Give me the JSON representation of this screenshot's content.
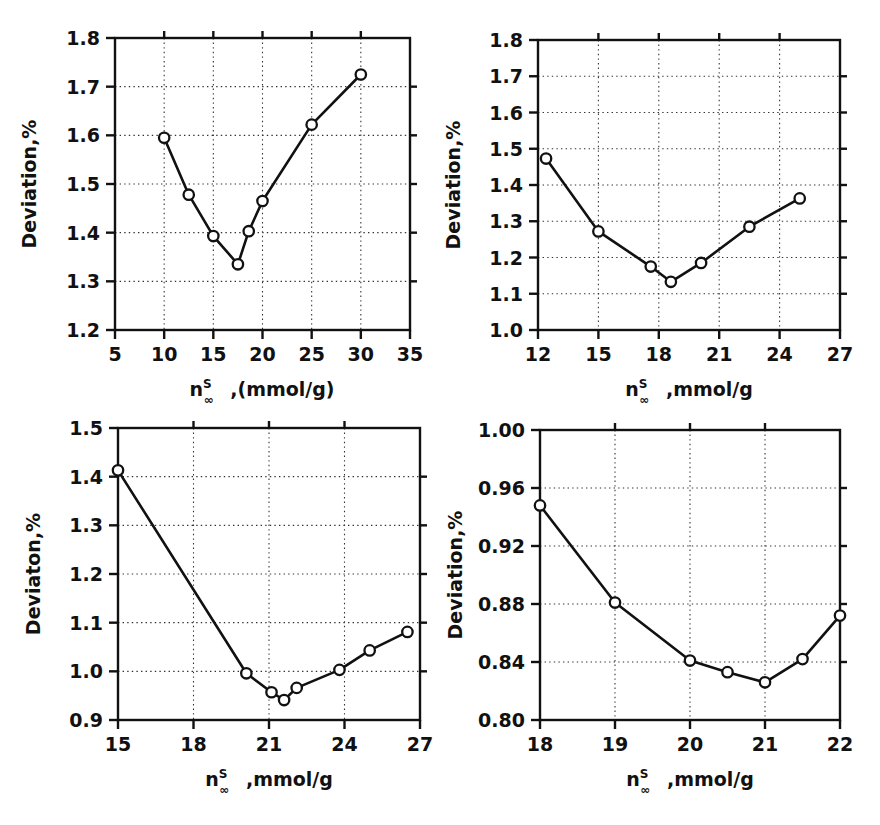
{
  "figure": {
    "title": "",
    "panel_count": 4,
    "marker_style": "open-circle",
    "line_color": "#111111",
    "marker_fill": "#ffffff",
    "grid_color": "#333333",
    "background": "#ffffff"
  },
  "chart_data": [
    {
      "id": "panel-a",
      "type": "line",
      "title": "",
      "xlabel": "n∞ᴿ ,(mmol/g)",
      "xlabel_parts": {
        "base": "n",
        "superscript": "S",
        "subscript": "∞",
        "rest": ",(mmol/g)"
      },
      "ylabel": "Deviation,%",
      "xlim": [
        5,
        35
      ],
      "ylim": [
        1.2,
        1.8
      ],
      "xticks": [
        5,
        10,
        15,
        20,
        25,
        30,
        35
      ],
      "xtick_labels": [
        "5",
        "10",
        "15",
        "20",
        "25",
        "30",
        "35"
      ],
      "yticks": [
        1.2,
        1.3,
        1.4,
        1.5,
        1.6,
        1.7,
        1.8
      ],
      "ytick_labels": [
        "1.2",
        "1.3",
        "1.4",
        "1.5",
        "1.6",
        "1.7",
        "1.8"
      ],
      "grid": true,
      "legend": "none",
      "x": [
        10.0,
        12.5,
        15.0,
        17.5,
        18.6,
        20.0,
        25.0,
        30.0
      ],
      "y": [
        1.595,
        1.478,
        1.393,
        1.335,
        1.403,
        1.465,
        1.622,
        1.725
      ]
    },
    {
      "id": "panel-b",
      "type": "line",
      "title": "",
      "xlabel": "n∞ᴿ ,mmol/g",
      "xlabel_parts": {
        "base": "n",
        "superscript": "S",
        "subscript": "∞",
        "rest": ",mmol/g"
      },
      "ylabel": "Deviation,%",
      "xlim": [
        12,
        27
      ],
      "ylim": [
        1.0,
        1.8
      ],
      "xticks": [
        12,
        15,
        18,
        21,
        24,
        27
      ],
      "xtick_labels": [
        "12",
        "15",
        "18",
        "21",
        "24",
        "27"
      ],
      "yticks": [
        1.0,
        1.1,
        1.2,
        1.3,
        1.4,
        1.5,
        1.6,
        1.7,
        1.8
      ],
      "ytick_labels": [
        "1.0",
        "1.1",
        "1.2",
        "1.3",
        "1.4",
        "1.5",
        "1.6",
        "1.7",
        "1.8"
      ],
      "grid": true,
      "legend": "none",
      "x": [
        12.4,
        15.0,
        17.6,
        18.6,
        20.1,
        22.5,
        25.0
      ],
      "y": [
        1.473,
        1.272,
        1.175,
        1.133,
        1.185,
        1.285,
        1.363
      ]
    },
    {
      "id": "panel-c",
      "type": "line",
      "title": "",
      "xlabel": "n∞ᴿ ,mmol/g",
      "xlabel_parts": {
        "base": "n",
        "superscript": "S",
        "subscript": "∞",
        "rest": ",mmol/g"
      },
      "ylabel": "Deviaton,%",
      "xlim": [
        15,
        27
      ],
      "ylim": [
        0.9,
        1.5
      ],
      "xticks": [
        15,
        18,
        21,
        24,
        27
      ],
      "xtick_labels": [
        "15",
        "18",
        "21",
        "24",
        "27"
      ],
      "yticks": [
        0.9,
        1.0,
        1.1,
        1.2,
        1.3,
        1.4,
        1.5
      ],
      "ytick_labels": [
        "0.9",
        "1.0",
        "1.1",
        "1.2",
        "1.3",
        "1.4",
        "1.5"
      ],
      "grid": true,
      "legend": "none",
      "x": [
        15.0,
        20.1,
        21.1,
        21.6,
        22.1,
        23.8,
        25.0,
        26.5
      ],
      "y": [
        1.413,
        0.996,
        0.957,
        0.941,
        0.966,
        1.003,
        1.043,
        1.081
      ]
    },
    {
      "id": "panel-d",
      "type": "line",
      "title": "",
      "xlabel": "n∞ᴿ ,mmol/g",
      "xlabel_parts": {
        "base": "n",
        "superscript": "S",
        "subscript": "∞",
        "rest": ",mmol/g"
      },
      "ylabel": "Deviation,%",
      "xlim": [
        18,
        22
      ],
      "ylim": [
        0.8,
        1.0
      ],
      "xticks": [
        18,
        19,
        20,
        21,
        22
      ],
      "xtick_labels": [
        "18",
        "19",
        "20",
        "21",
        "22"
      ],
      "yticks": [
        0.8,
        0.84,
        0.88,
        0.92,
        0.96,
        1.0
      ],
      "ytick_labels": [
        "0.80",
        "0.84",
        "0.88",
        "0.92",
        "0.96",
        "1.00"
      ],
      "grid": true,
      "legend": "none",
      "x": [
        18.0,
        19.0,
        20.0,
        20.5,
        21.0,
        21.5,
        22.0
      ],
      "y": [
        0.948,
        0.881,
        0.841,
        0.833,
        0.826,
        0.842,
        0.872
      ]
    }
  ]
}
